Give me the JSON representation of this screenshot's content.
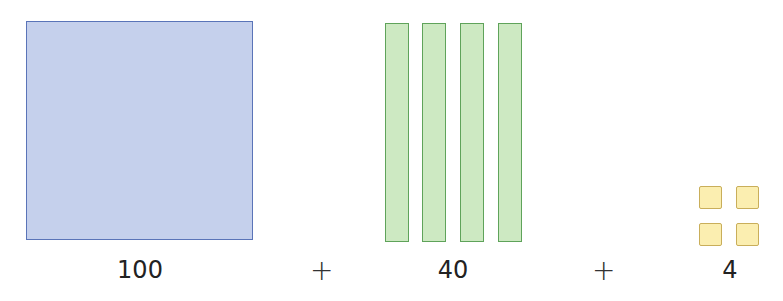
{
  "diagram": {
    "groups": [
      {
        "name": "hundreds",
        "count": 1,
        "label": "100",
        "color": "#c5d0ec",
        "border": "#5a74b8"
      },
      {
        "name": "tens",
        "count": 4,
        "label": "40",
        "color": "#cde9c2",
        "border": "#5fa35a"
      },
      {
        "name": "ones",
        "count": 4,
        "label": "4",
        "color": "#fbeeb0",
        "border": "#c9ae5a"
      }
    ],
    "operators": [
      "+",
      "+"
    ]
  }
}
